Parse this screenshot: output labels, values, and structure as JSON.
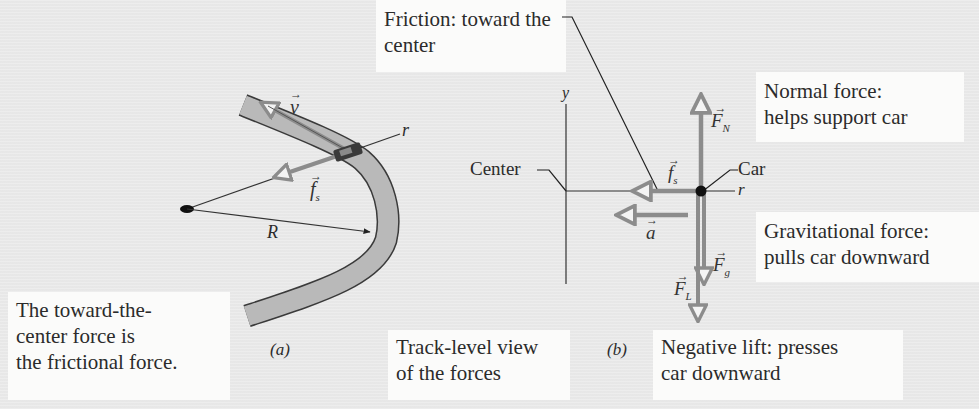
{
  "figure": {
    "panel_a": {
      "label": "(a)",
      "caption_lines": [
        "The toward-the-",
        "center force is",
        "the frictional force."
      ],
      "vectors": {
        "velocity": "v",
        "friction": "f",
        "friction_sub": "s"
      },
      "axis_label": "r",
      "radius_label": "R"
    },
    "panel_b": {
      "label": "(b)",
      "caption_lines": [
        "Track-level view",
        "of the forces"
      ],
      "axis_y": "y",
      "axis_r": "r",
      "center_label": "Center",
      "car_label": "Car",
      "vectors": {
        "normal": "F",
        "normal_sub": "N",
        "friction": "f",
        "friction_sub": "s",
        "accel": "a",
        "gravity": "F",
        "gravity_sub": "g",
        "lift": "F",
        "lift_sub": "L"
      }
    },
    "callouts": {
      "friction_lines": [
        "Friction: toward the",
        "center"
      ],
      "normal_lines": [
        "Normal force:",
        "helps support car"
      ],
      "gravity_lines": [
        "Gravitational force:",
        "pulls car downward"
      ],
      "lift_lines": [
        "Negative lift: presses",
        "car downward"
      ]
    },
    "colors": {
      "background": "#ececec",
      "box": "#fbfbfa",
      "track_fill": "#b8b8b8",
      "arrow_gray": "#8c8c8c",
      "line": "#333333"
    }
  }
}
